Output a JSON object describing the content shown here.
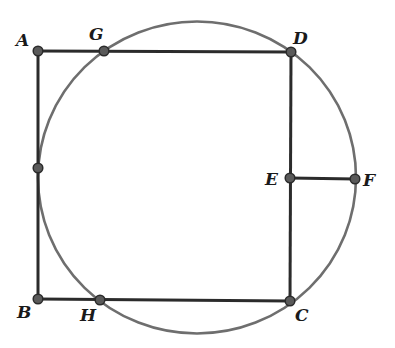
{
  "figure": {
    "colors": {
      "segment": "#2b2b2b",
      "circle": "#6e6e6e",
      "point_fill": "#5a5a5a",
      "point_stroke": "#2b2b2b",
      "label": "#1a1a1a"
    },
    "circle": {
      "cx": 197,
      "cy": 177.5,
      "rx": 159,
      "ry": 156
    },
    "points": {
      "A": {
        "label": "A",
        "x": 38,
        "y": 51
      },
      "G": {
        "label": "G",
        "x": 104,
        "y": 51
      },
      "D": {
        "label": "D",
        "x": 291,
        "y": 52
      },
      "T": {
        "label": "",
        "x": 38,
        "y": 168
      },
      "E": {
        "label": "E",
        "x": 290,
        "y": 178
      },
      "F": {
        "label": "F",
        "x": 355,
        "y": 179
      },
      "B": {
        "label": "B",
        "x": 38,
        "y": 299
      },
      "H": {
        "label": "H",
        "x": 100,
        "y": 300
      },
      "C": {
        "label": "C",
        "x": 290,
        "y": 301
      }
    },
    "segments": [
      [
        "A",
        "D"
      ],
      [
        "A",
        "B"
      ],
      [
        "B",
        "C"
      ],
      [
        "D",
        "C"
      ],
      [
        "E",
        "F"
      ]
    ],
    "labels": {
      "A": "A",
      "G": "G",
      "D": "D",
      "E": "E",
      "F": "F",
      "B": "B",
      "H": "H",
      "C": "C"
    }
  }
}
